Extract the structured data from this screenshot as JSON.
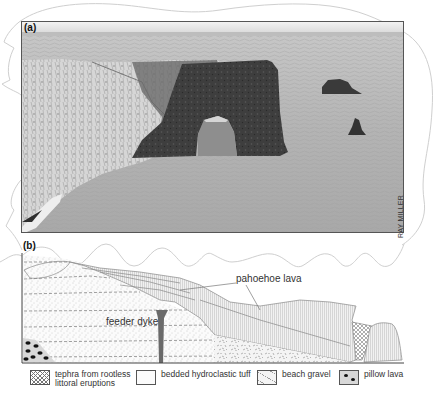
{
  "figure": {
    "panel_a": {
      "label": "(a)",
      "photo_subject": "sea arch and stacks off coastal cliff (black-and-white photograph)",
      "credit": "RAY MILLER"
    },
    "panel_b": {
      "label": "(b)",
      "annotations": {
        "pahoehoe_lava": "pahoehoe lava",
        "feeder_dyke": "feeder dyke"
      }
    },
    "legend": [
      {
        "id": "tephra",
        "icon": "crosshatch-swatch-icon",
        "line1": "tephra from rootless",
        "line2": "littoral eruptions"
      },
      {
        "id": "tuff",
        "icon": "stipple-swatch-icon",
        "line1": "bedded hydroclastic tuff",
        "line2": ""
      },
      {
        "id": "gravel",
        "icon": "gravel-swatch-icon",
        "line1": "beach gravel",
        "line2": ""
      },
      {
        "id": "pillow",
        "icon": "dots-swatch-icon",
        "line1": "pillow lava",
        "line2": ""
      }
    ],
    "colors": {
      "frame": "#555555",
      "outline": "#c8c8c8",
      "text": "#333333",
      "dyke": "#6a6a6a"
    }
  }
}
